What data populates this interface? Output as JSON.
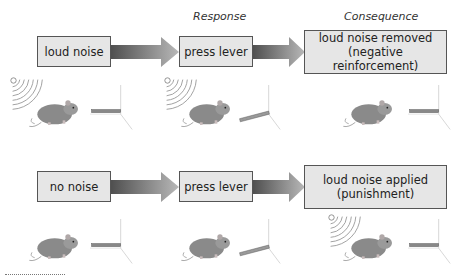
{
  "headers": {
    "response": "Response",
    "consequence": "Consequence"
  },
  "rows": [
    {
      "stimulus": "loud noise",
      "response": "press lever",
      "consequence_line1": "loud noise removed",
      "consequence_line2": "(negative reinforcement)"
    },
    {
      "stimulus": "no noise",
      "response": "press lever",
      "consequence_line1": "loud noise applied",
      "consequence_line2": "(punishment)"
    }
  ],
  "colors": {
    "box_fill": "#e6e6e6",
    "box_border": "#555555",
    "arrow_dark": "#555555",
    "arrow_light": "#b0b0b0"
  }
}
